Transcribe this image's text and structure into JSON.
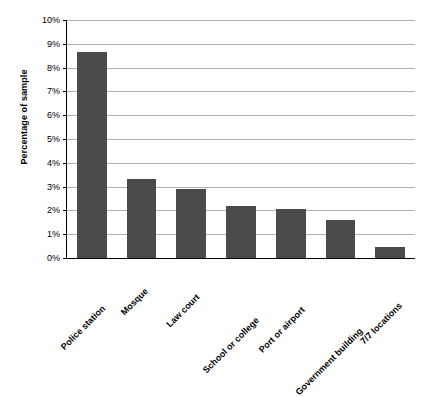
{
  "chart_data": {
    "type": "bar",
    "title": "",
    "subtitle": "",
    "xlabel": "",
    "ylabel": "Percentage of sample",
    "categories": [
      "Police station",
      "Mosque",
      "Law court",
      "School or college",
      "Port or airport",
      "Government building",
      "7/7 locations"
    ],
    "values": [
      8.65,
      3.3,
      2.9,
      2.2,
      2.05,
      1.6,
      0.45
    ],
    "ylim": [
      0,
      10
    ],
    "ytick_values": [
      0,
      1,
      2,
      3,
      4,
      5,
      6,
      7,
      8,
      9,
      10
    ],
    "ytick_labels": [
      "0%",
      "1%",
      "2%",
      "3%",
      "4%",
      "5%",
      "6%",
      "7%",
      "8%",
      "9%",
      "10%"
    ],
    "grid": true,
    "grid_axis": "y",
    "legend": false,
    "legend_position": "none",
    "bar_color": "#4a4a4a",
    "gridline_color": "#b0b0b0",
    "axis_color": "#000000",
    "background_color": "#ffffff",
    "xtick_label_rotation": -45
  }
}
